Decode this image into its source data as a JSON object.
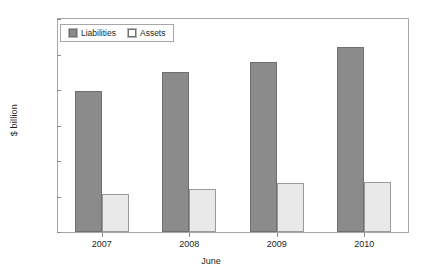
{
  "chart_data": {
    "type": "bar",
    "title": "",
    "xlabel": "June",
    "ylabel": "$ billion",
    "categories": [
      "2007",
      "2008",
      "2009",
      "2010"
    ],
    "series": [
      {
        "name": "Liabilities",
        "color": "#8b8b8b",
        "values": [
          397,
          451,
          479,
          521
        ]
      },
      {
        "name": "Assets",
        "color": "#e9e9e9",
        "values": [
          108,
          120,
          137,
          140
        ]
      }
    ],
    "ylim": [
      0,
      600
    ],
    "ytick_labels": [
      "0",
      "100",
      "200",
      "300",
      "400",
      "500",
      "600"
    ],
    "ytick_values": [
      0,
      100,
      200,
      300,
      400,
      500,
      600
    ],
    "grid": false,
    "legend_position": "top-left"
  }
}
